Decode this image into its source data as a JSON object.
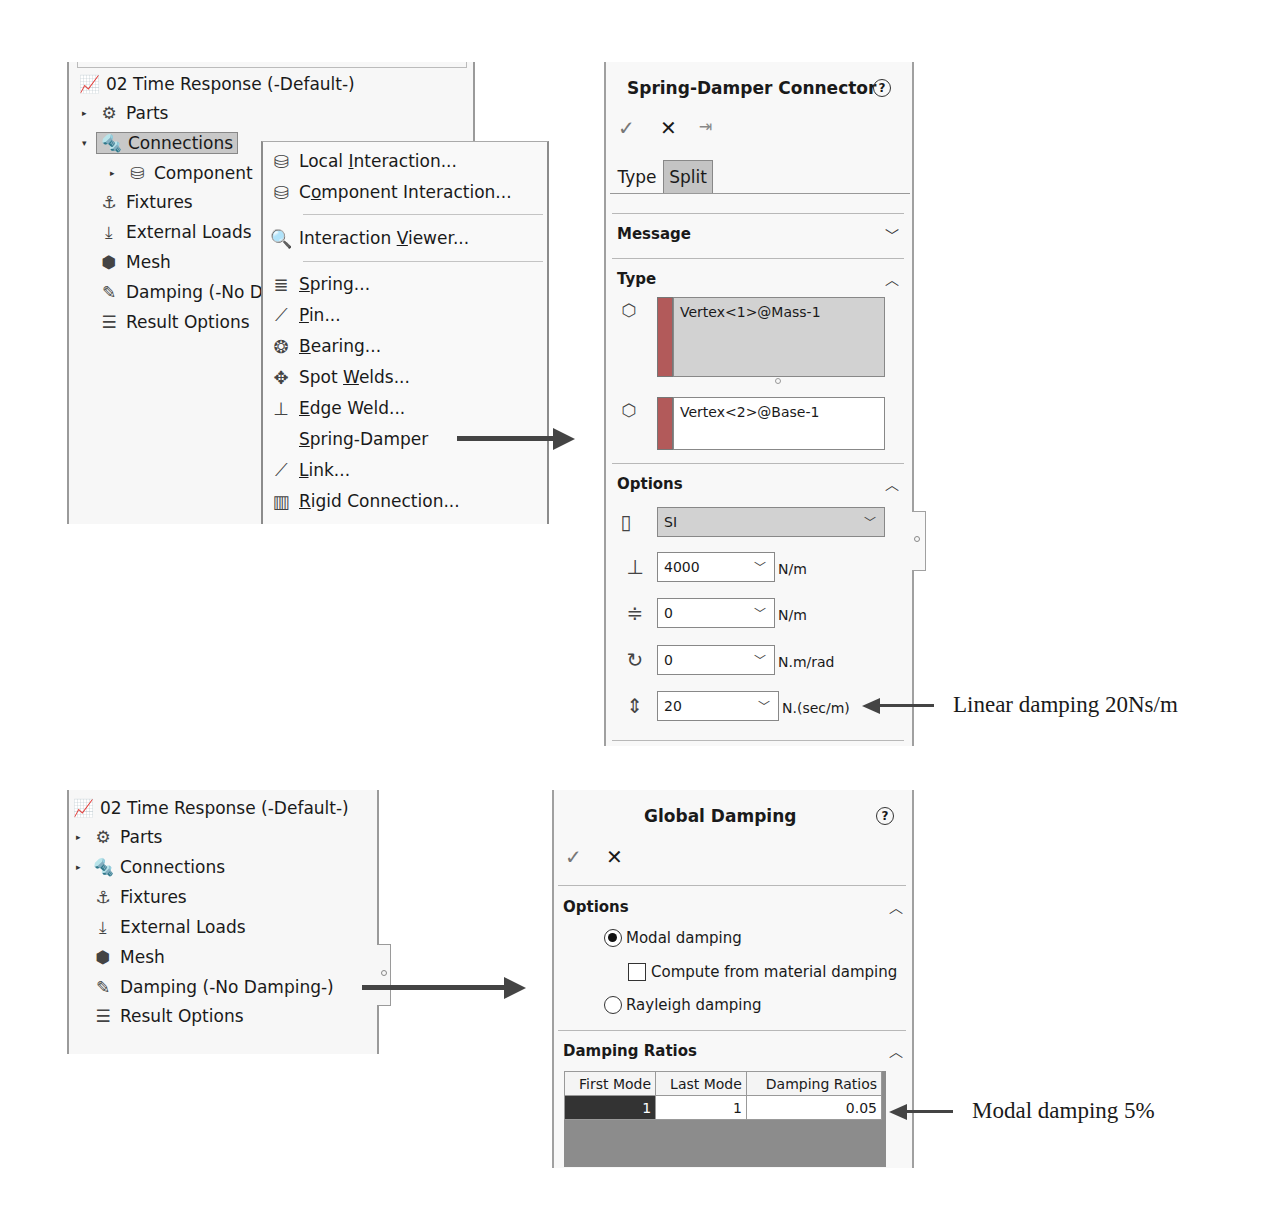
{
  "top": {
    "tree": {
      "root": "02 Time Response (-Default-)",
      "items": [
        {
          "label": "Parts",
          "caret": "▸",
          "icon": "parts-icon"
        },
        {
          "label": "Connections",
          "caret": "▾",
          "icon": "connections-icon",
          "selected": true
        },
        {
          "label": "Component",
          "caret": "▸",
          "icon": "component-icon"
        },
        {
          "label": "Fixtures",
          "icon": "fixtures-icon"
        },
        {
          "label": "External Loads",
          "icon": "external-loads-icon"
        },
        {
          "label": "Mesh",
          "icon": "mesh-icon"
        },
        {
          "label": "Damping (-No D",
          "icon": "damping-icon"
        },
        {
          "label": "Result Options",
          "icon": "result-options-icon"
        }
      ]
    },
    "context_menu": {
      "items": [
        {
          "pre": "Local ",
          "u": "I",
          "post": "nteraction...",
          "icon": "local-interaction-icon"
        },
        {
          "pre": "C",
          "u": "o",
          "post": "mponent Interaction...",
          "icon": "component-interaction-icon"
        },
        {
          "pre": "Interaction ",
          "u": "V",
          "post": "iewer...",
          "icon": "interaction-viewer-icon"
        },
        {
          "pre": "",
          "u": "S",
          "post": "pring...",
          "icon": "spring-icon"
        },
        {
          "pre": "",
          "u": "P",
          "post": "in...",
          "icon": "pin-icon"
        },
        {
          "pre": "",
          "u": "B",
          "post": "earing...",
          "icon": "bearing-icon"
        },
        {
          "pre": "Spot ",
          "u": "W",
          "post": "elds...",
          "icon": "spot-welds-icon"
        },
        {
          "pre": "",
          "u": "E",
          "post": "dge Weld...",
          "icon": "edge-weld-icon"
        },
        {
          "pre": "",
          "u": "S",
          "post": "pring-Damper",
          "icon": ""
        },
        {
          "pre": "",
          "u": "L",
          "post": "ink...",
          "icon": "link-icon"
        },
        {
          "pre": "",
          "u": "R",
          "post": "igid Connection...",
          "icon": "rigid-connection-icon"
        }
      ]
    },
    "property_manager": {
      "title": "Spring-Damper Connector",
      "help": "?",
      "actions": {
        "ok": "✓",
        "cancel": "✕",
        "pin": "⇥"
      },
      "tabs": [
        "Type",
        "Split"
      ],
      "sections": {
        "message": "Message",
        "type": "Type",
        "options": "Options"
      },
      "selections": [
        "Vertex<1>@Mass-1",
        "Vertex<2>@Base-1"
      ],
      "units": "SI",
      "fields": [
        {
          "value": "4000",
          "unit": "N/m",
          "icon": "axial-stiffness-icon"
        },
        {
          "value": "0",
          "unit": "N/m",
          "icon": "lateral-stiffness-icon"
        },
        {
          "value": "0",
          "unit": "N.m/rad",
          "icon": "torsional-stiffness-icon"
        },
        {
          "value": "20",
          "unit": "N.(sec/m)",
          "icon": "linear-damping-icon"
        }
      ]
    },
    "annotation": "Linear damping 20Ns/m"
  },
  "bottom": {
    "tree": {
      "root": "02 Time Response (-Default-)",
      "items": [
        {
          "label": "Parts",
          "caret": "▸"
        },
        {
          "label": "Connections",
          "caret": "▸"
        },
        {
          "label": "Fixtures"
        },
        {
          "label": "External Loads"
        },
        {
          "label": "Mesh"
        },
        {
          "label": "Damping (-No Damping-)"
        },
        {
          "label": "Result Options"
        }
      ]
    },
    "property_manager": {
      "title": "Global Damping",
      "help": "?",
      "actions": {
        "ok": "✓",
        "cancel": "✕"
      },
      "options_header": "Options",
      "modal_damping": "Modal damping",
      "compute_from_material": "Compute from material damping",
      "rayleigh_damping": "Rayleigh damping",
      "ratios_header": "Damping Ratios",
      "table": {
        "columns": [
          "First Mode",
          "Last Mode",
          "Damping Ratios"
        ],
        "rows": [
          [
            "1",
            "1",
            "0.05"
          ]
        ]
      }
    },
    "annotation": "Modal damping 5%"
  }
}
